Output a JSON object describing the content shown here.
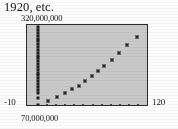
{
  "figure": {
    "caption": "1920, etc.",
    "background_color": "#fdfdfd",
    "plot_background_color": "#c9c9c9",
    "border_color": "#2b2b2b",
    "marker_color": "#232323"
  },
  "labels": {
    "y_max": "320,000,000",
    "y_min": "70,000,000",
    "x_min": "-10",
    "x_max": "120"
  },
  "chart_data": {
    "type": "scatter",
    "title": "1920, etc.",
    "xlabel": "",
    "ylabel": "",
    "xlim": [
      -10,
      120
    ],
    "ylim": [
      70000000,
      320000000
    ],
    "grid": false,
    "legend": null,
    "xtick_labels": [
      "-10",
      "120"
    ],
    "ytick_labels": [
      "70,000,000",
      "320,000,000"
    ],
    "series": [
      {
        "name": "vertical-cluster",
        "marker": "square",
        "x": [
          0,
          0,
          0,
          0,
          0,
          0,
          0,
          0,
          0,
          0,
          0,
          0,
          0,
          0,
          0,
          0,
          0,
          0,
          0,
          0,
          0,
          0,
          0,
          0,
          0,
          0
        ],
        "y": [
          318000000,
          309000000,
          300000000,
          291000000,
          282000000,
          273000000,
          264000000,
          255000000,
          246000000,
          237000000,
          228000000,
          219000000,
          210000000,
          201000000,
          192000000,
          183000000,
          174000000,
          165000000,
          156000000,
          147000000,
          138000000,
          129000000,
          120000000,
          111000000,
          95000000,
          73000000
        ]
      },
      {
        "name": "rising-scatter",
        "marker": "square",
        "x": [
          11,
          21,
          30,
          38,
          45,
          52,
          59,
          66,
          73,
          81,
          89,
          98,
          108
        ],
        "y": [
          84000000,
          97000000,
          110000000,
          121000000,
          133000000,
          148000000,
          162000000,
          178000000,
          195000000,
          214000000,
          236000000,
          262000000,
          288000000
        ]
      }
    ],
    "xtick_positions": [
      0,
      10,
      20,
      30,
      40,
      50,
      60,
      70,
      80,
      90,
      100,
      110,
      120
    ]
  }
}
